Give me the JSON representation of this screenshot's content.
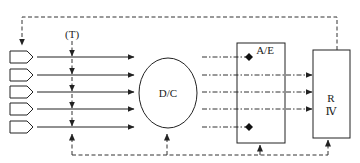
{
  "diagram": {
    "labels": {
      "timing": "(T)",
      "center_node": "D/C",
      "ae_box": "A/E",
      "r_box_line1": "R",
      "r_box_line2": "Ⅳ"
    },
    "inputs": [
      {
        "row": 1,
        "y": 57
      },
      {
        "row": 2,
        "y": 75
      },
      {
        "row": 3,
        "y": 92
      },
      {
        "row": 4,
        "y": 109
      },
      {
        "row": 5,
        "y": 127
      }
    ],
    "dashdot_rows": [
      {
        "row": 1,
        "ends_at": "ae-diamond"
      },
      {
        "row": 2,
        "ends_at": "r-box-arrow"
      },
      {
        "row": 3,
        "ends_at": "r-box-arrow"
      },
      {
        "row": 4,
        "ends_at": "r-box-arrow"
      },
      {
        "row": 5,
        "ends_at": "ae-diamond"
      }
    ],
    "colors": {
      "stroke": "#222222",
      "background": "#ffffff"
    }
  }
}
